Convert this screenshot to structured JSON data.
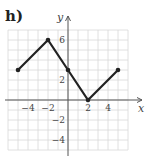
{
  "panel_label": "h)",
  "chart_data": {
    "type": "line",
    "title": "",
    "xlabel": "x",
    "ylabel": "y",
    "xlim": [
      -6,
      6
    ],
    "ylim": [
      -5,
      7
    ],
    "grid": true,
    "x_ticks": [
      -4,
      -2,
      2,
      4
    ],
    "y_ticks": [
      6,
      2,
      -2,
      -4
    ],
    "x_tick_labels": [
      "−4",
      "−2",
      "2",
      "4"
    ],
    "y_tick_labels": [
      "6",
      "2",
      "−2",
      "−4"
    ],
    "series": [
      {
        "name": "piecewise linear",
        "points": [
          [
            -5,
            3
          ],
          [
            -2,
            6
          ],
          [
            0,
            3
          ],
          [
            2,
            0
          ],
          [
            5,
            3
          ]
        ],
        "color": "#222222",
        "markers": "filled-circle"
      }
    ],
    "grid_color": "#d8d8d8",
    "axis_color": "#555555"
  }
}
